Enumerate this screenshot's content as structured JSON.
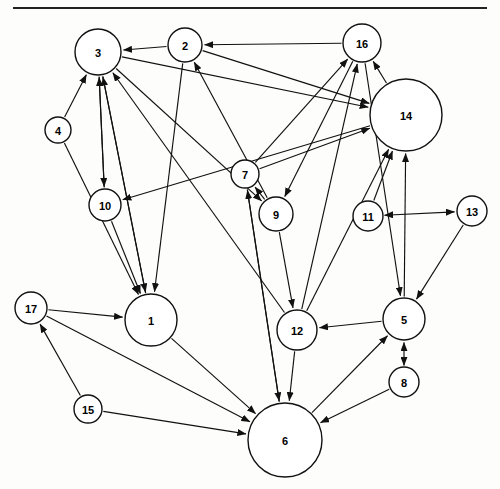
{
  "figure": {
    "title": "",
    "kind": "directed-graph-diagram",
    "background_color": "#fdfdfc",
    "ink_color": "#111111",
    "width": 500,
    "height": 489,
    "top_rule": {
      "x1": 13,
      "y1": 8,
      "x2": 487,
      "y2": 8
    }
  },
  "chart_data": {
    "type": "diagram",
    "subtype": "directed-graph",
    "title": "",
    "xlabel": "",
    "ylabel": "",
    "directed": true,
    "node_count": 17,
    "edge_count": 38,
    "nodes": [
      {
        "id": "1",
        "label": "1",
        "x": 151,
        "y": 320,
        "r": 26
      },
      {
        "id": "2",
        "label": "2",
        "x": 185,
        "y": 45,
        "r": 17
      },
      {
        "id": "3",
        "label": "3",
        "x": 98,
        "y": 52,
        "r": 23
      },
      {
        "id": "4",
        "label": "4",
        "x": 58,
        "y": 130,
        "r": 13
      },
      {
        "id": "5",
        "label": "5",
        "x": 404,
        "y": 319,
        "r": 21
      },
      {
        "id": "6",
        "label": "6",
        "x": 285,
        "y": 440,
        "r": 37
      },
      {
        "id": "7",
        "label": "7",
        "x": 245,
        "y": 174,
        "r": 14
      },
      {
        "id": "8",
        "label": "8",
        "x": 404,
        "y": 382,
        "r": 15
      },
      {
        "id": "9",
        "label": "9",
        "x": 276,
        "y": 214,
        "r": 17
      },
      {
        "id": "10",
        "label": "10",
        "x": 105,
        "y": 205,
        "r": 16
      },
      {
        "id": "11",
        "label": "11",
        "x": 368,
        "y": 216,
        "r": 15
      },
      {
        "id": "12",
        "label": "12",
        "x": 297,
        "y": 330,
        "r": 20
      },
      {
        "id": "13",
        "label": "13",
        "x": 472,
        "y": 211,
        "r": 15
      },
      {
        "id": "14",
        "label": "14",
        "x": 406,
        "y": 115,
        "r": 36
      },
      {
        "id": "15",
        "label": "15",
        "x": 88,
        "y": 409,
        "r": 14
      },
      {
        "id": "16",
        "label": "16",
        "x": 362,
        "y": 43,
        "r": 19
      },
      {
        "id": "17",
        "label": "17",
        "x": 31,
        "y": 308,
        "r": 16
      }
    ],
    "edges": [
      {
        "from": "16",
        "to": "2",
        "arrows": "to"
      },
      {
        "from": "2",
        "to": "3",
        "arrows": "to"
      },
      {
        "from": "4",
        "to": "3",
        "arrows": "to"
      },
      {
        "from": "10",
        "to": "3",
        "arrows": "to"
      },
      {
        "from": "1",
        "to": "3",
        "arrows": "to"
      },
      {
        "from": "12",
        "to": "3",
        "arrows": "to"
      },
      {
        "from": "9",
        "to": "2",
        "arrows": "to"
      },
      {
        "from": "3",
        "to": "14",
        "arrows": "to"
      },
      {
        "from": "2",
        "to": "14",
        "arrows": "to"
      },
      {
        "from": "7",
        "to": "14",
        "arrows": "to"
      },
      {
        "from": "11",
        "to": "14",
        "arrows": "to"
      },
      {
        "from": "5",
        "to": "14",
        "arrows": "to"
      },
      {
        "from": "12",
        "to": "14",
        "arrows": "to"
      },
      {
        "from": "14",
        "to": "16",
        "arrows": "to"
      },
      {
        "from": "7",
        "to": "16",
        "arrows": "to"
      },
      {
        "from": "12",
        "to": "16",
        "arrows": "to"
      },
      {
        "from": "3",
        "to": "9",
        "arrows": "to"
      },
      {
        "from": "16",
        "to": "9",
        "arrows": "to"
      },
      {
        "from": "9",
        "to": "7",
        "arrows": "to"
      },
      {
        "from": "6",
        "to": "7",
        "arrows": "to"
      },
      {
        "from": "4",
        "to": "1",
        "arrows": "to"
      },
      {
        "from": "10",
        "to": "1",
        "arrows": "to"
      },
      {
        "from": "3",
        "to": "1",
        "arrows": "to"
      },
      {
        "from": "2",
        "to": "1",
        "arrows": "to"
      },
      {
        "from": "17",
        "to": "1",
        "arrows": "to"
      },
      {
        "from": "3",
        "to": "10",
        "arrows": "to"
      },
      {
        "from": "14",
        "to": "10",
        "arrows": "to"
      },
      {
        "from": "11",
        "to": "13",
        "arrows": "both"
      },
      {
        "from": "13",
        "to": "5",
        "arrows": "to"
      },
      {
        "from": "16",
        "to": "5",
        "arrows": "to"
      },
      {
        "from": "6",
        "to": "5",
        "arrows": "to"
      },
      {
        "from": "8",
        "to": "5",
        "arrows": "both"
      },
      {
        "from": "9",
        "to": "12",
        "arrows": "to"
      },
      {
        "from": "5",
        "to": "12",
        "arrows": "to"
      },
      {
        "from": "12",
        "to": "6",
        "arrows": "to"
      },
      {
        "from": "1",
        "to": "6",
        "arrows": "to"
      },
      {
        "from": "17",
        "to": "6",
        "arrows": "to"
      },
      {
        "from": "15",
        "to": "6",
        "arrows": "to"
      },
      {
        "from": "8",
        "to": "6",
        "arrows": "to"
      },
      {
        "from": "7",
        "to": "6",
        "arrows": "to"
      },
      {
        "from": "15",
        "to": "17",
        "arrows": "to"
      }
    ]
  }
}
